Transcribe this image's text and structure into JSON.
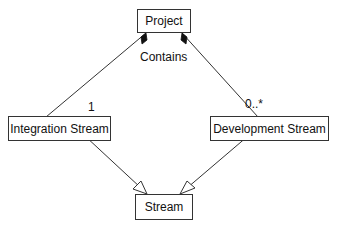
{
  "diagram": {
    "type": "UML class diagram",
    "nodes": {
      "project": "Project",
      "integration_stream": "Integration Stream",
      "development_stream": "Development Stream",
      "stream": "Stream"
    },
    "edges": [
      {
        "from": "Project",
        "to": "Integration Stream",
        "kind": "composition",
        "multiplicity": "1"
      },
      {
        "from": "Project",
        "to": "Development Stream",
        "kind": "composition",
        "multiplicity": "0..*"
      },
      {
        "from": "Integration Stream",
        "to": "Stream",
        "kind": "generalization"
      },
      {
        "from": "Development Stream",
        "to": "Stream",
        "kind": "generalization"
      }
    ],
    "labels": {
      "association": "Contains",
      "mult_integration": "1",
      "mult_development": "0..*"
    }
  }
}
